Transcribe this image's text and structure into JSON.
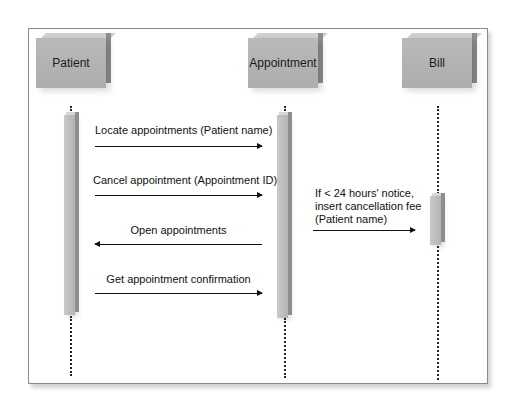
{
  "diagram": {
    "type": "sequence",
    "objects": [
      {
        "id": "patient",
        "label": "Patient"
      },
      {
        "id": "appointment",
        "label": "Appointment"
      },
      {
        "id": "bill",
        "label": "Bill"
      }
    ],
    "messages": [
      {
        "label": "Locate appointments (Patient name)",
        "from": "Patient",
        "to": "Appointment",
        "direction": "right"
      },
      {
        "label": "Cancel appointment (Appointment ID)",
        "from": "Patient",
        "to": "Appointment",
        "direction": "right"
      },
      {
        "label": "Open appointments",
        "from": "Appointment",
        "to": "Patient",
        "direction": "left"
      },
      {
        "label": "Get appointment confirmation",
        "from": "Patient",
        "to": "Appointment",
        "direction": "right"
      }
    ],
    "note_message": {
      "lines": [
        "If < 24 hours' notice,",
        "insert cancellation fee",
        "(Patient name)"
      ],
      "from": "Appointment",
      "to": "Bill",
      "direction": "right"
    }
  }
}
